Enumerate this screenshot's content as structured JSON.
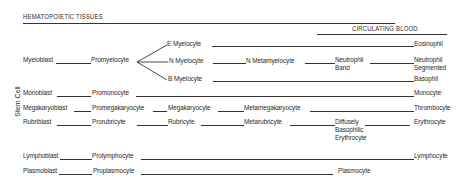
{
  "title": "HEMATOPOIETIC TISSUES",
  "circulating_header": "CIRCULATING BLOOD",
  "side_label": "Stem Cell",
  "rows": {
    "myelo": {
      "blast": "Myeloblast",
      "pro": "Promyelocyte",
      "e_myelocyte": "E  Myelocyte",
      "n_myelocyte": "N  Myelocyte",
      "b_myelocyte": "B  Myelocyte",
      "n_metamyelocyte": "N  Metamyelocyte",
      "neutrophil_band_1": "Neutrophil",
      "neutrophil_band_2": "Band",
      "eosinophil": "Eosinophil",
      "neutrophil_seg_1": "Neutrophil",
      "neutrophil_seg_2": "Segmented",
      "basophil": "Basophil"
    },
    "mono": {
      "blast": "Monoblast",
      "pro": "Promonocyte",
      "mature": "Monocyte"
    },
    "mega": {
      "blast": "Megakaryoblast",
      "pro": "Promegakaryocyte",
      "mid": "Megakaryocyte",
      "meta": "Metamegakaryocyte",
      "mature": "Thrombocyte"
    },
    "rubri": {
      "blast": "Rubriblast",
      "pro": "Prorubricyte",
      "mid": "Rubricyte",
      "meta": "Metarubricyte",
      "diffuse_1": "Diffusely",
      "diffuse_2": "Basophilic",
      "diffuse_3": "Erythrocyte",
      "mature": "Erythrocyte"
    },
    "lympho": {
      "blast": "Lymphoblast",
      "pro": "Prolymphocyte",
      "mature": "Lymphocyte"
    },
    "plasma": {
      "blast": "Plasmoblast",
      "pro": "Proplasmocyte",
      "mature": "Plasmocyte"
    }
  }
}
